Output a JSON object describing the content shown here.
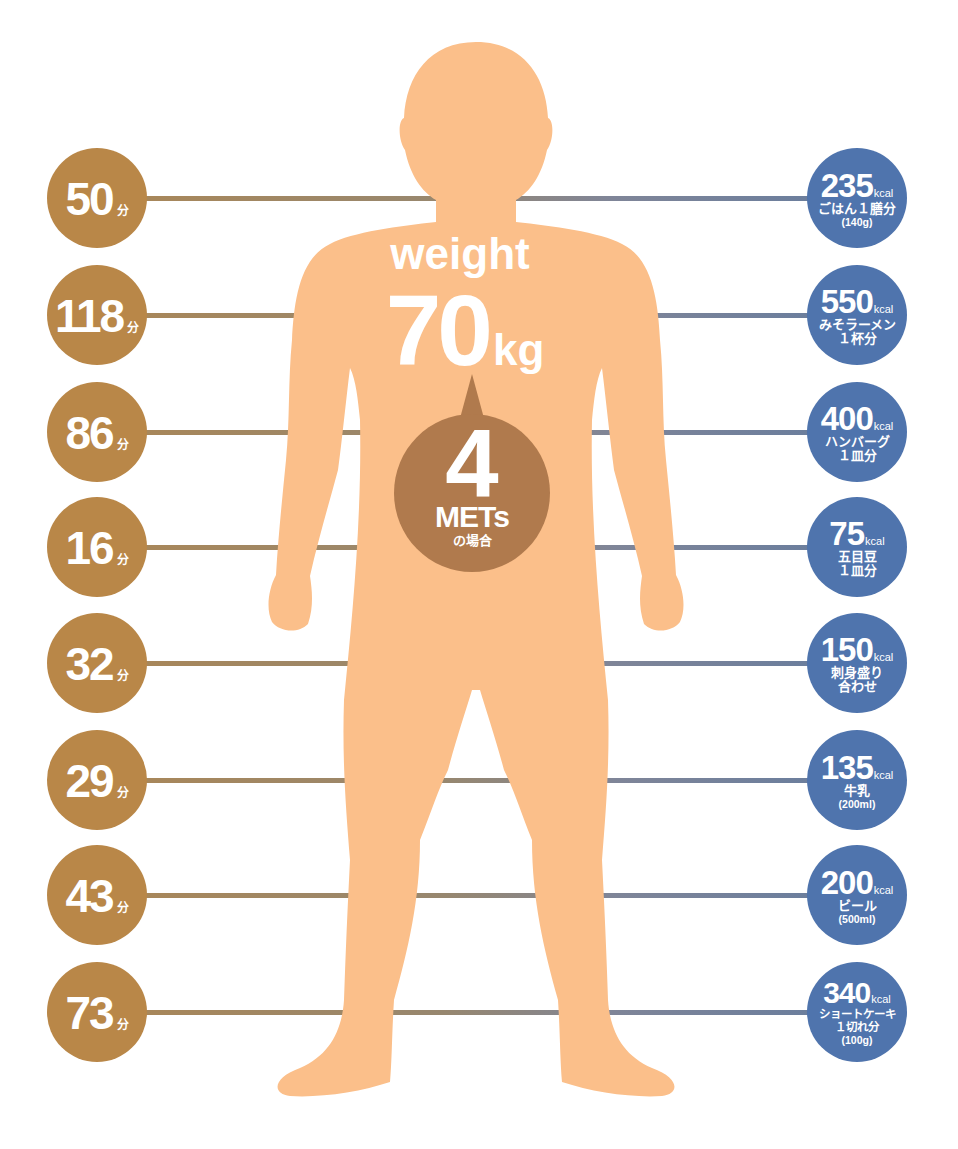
{
  "colors": {
    "background": "#ffffff",
    "body_silhouette": "#fbbf8a",
    "left_circle": "#b98748",
    "right_circle": "#4f74ad",
    "mets_bubble": "#b07a4d",
    "line_left": "#a8875a",
    "line_right": "#6b7e9d",
    "text": "#ffffff"
  },
  "center": {
    "weight_label": "weight",
    "weight_value": "70",
    "weight_unit": "kg",
    "mets_value": "4",
    "mets_label": "METs",
    "mets_sub": "の場合"
  },
  "rows": [
    {
      "minutes": "50",
      "minutes_unit": "分",
      "kcal": "235",
      "kcal_unit": "kcal",
      "food_lines": [
        "ごはん１膳分",
        "(140g)"
      ]
    },
    {
      "minutes": "118",
      "minutes_unit": "分",
      "kcal": "550",
      "kcal_unit": "kcal",
      "food_lines": [
        "みそラーメン",
        "１杯分"
      ]
    },
    {
      "minutes": "86",
      "minutes_unit": "分",
      "kcal": "400",
      "kcal_unit": "kcal",
      "food_lines": [
        "ハンバーグ",
        "１皿分"
      ]
    },
    {
      "minutes": "16",
      "minutes_unit": "分",
      "kcal": "75",
      "kcal_unit": "kcal",
      "food_lines": [
        "五目豆",
        "１皿分"
      ]
    },
    {
      "minutes": "32",
      "minutes_unit": "分",
      "kcal": "150",
      "kcal_unit": "kcal",
      "food_lines": [
        "刺身盛り",
        "合わせ"
      ]
    },
    {
      "minutes": "29",
      "minutes_unit": "分",
      "kcal": "135",
      "kcal_unit": "kcal",
      "food_lines": [
        "牛乳",
        "(200ml)"
      ]
    },
    {
      "minutes": "43",
      "minutes_unit": "分",
      "kcal": "200",
      "kcal_unit": "kcal",
      "food_lines": [
        "ビール",
        "(500ml)"
      ]
    },
    {
      "minutes": "73",
      "minutes_unit": "分",
      "kcal": "340",
      "kcal_unit": "kcal",
      "food_lines": [
        "ショートケーキ",
        "１切れ分",
        "(100g)"
      ]
    }
  ]
}
